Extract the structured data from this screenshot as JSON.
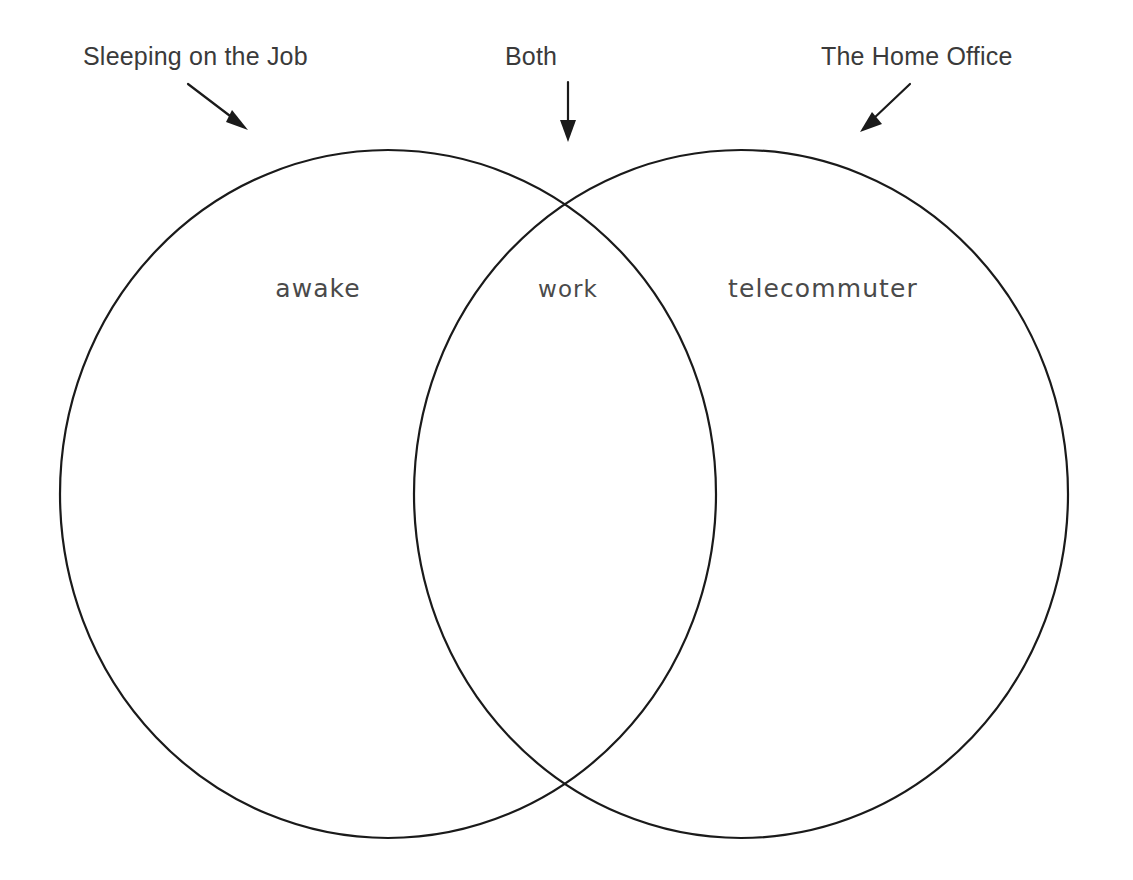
{
  "diagram": {
    "type": "venn",
    "title_present": false,
    "background_color": "#ffffff",
    "stroke_color": "#1a1a1a",
    "callouts": [
      {
        "id": "left",
        "label": "Sleeping on the Job",
        "arrow": "arrow-down-right",
        "points_to": "left-circle"
      },
      {
        "id": "middle",
        "label": "Both",
        "arrow": "arrow-down",
        "points_to": "overlap-region"
      },
      {
        "id": "right",
        "label": "The Home Office",
        "arrow": "arrow-down-left",
        "points_to": "right-circle"
      }
    ],
    "regions": [
      {
        "id": "left-only",
        "word": "awake"
      },
      {
        "id": "overlap",
        "word": "work"
      },
      {
        "id": "right-only",
        "word": "telecommuter"
      }
    ]
  }
}
